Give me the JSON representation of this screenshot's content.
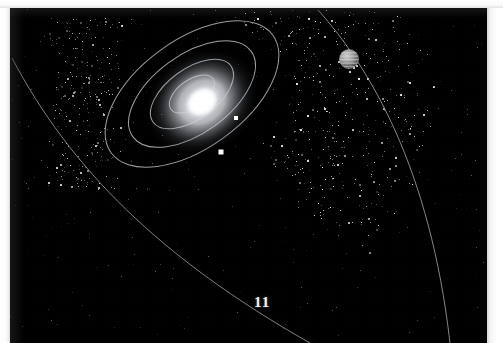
{
  "page": {
    "number": "11",
    "kind": "scanned-book-illustration",
    "background_color": "#000000",
    "paper_color": "#ffffff",
    "width": 503,
    "height": 343
  },
  "scene": {
    "title": "Solar system with central star, inner orbits and outer gas giant",
    "star": {
      "name": "central-star",
      "center_x": 202,
      "center_y": 102,
      "core_radius": 15,
      "glow_radius": 62,
      "color": "#ffffff",
      "halo_color": "#cfd4dc"
    },
    "orbits": [
      {
        "name": "orbit-1",
        "rx": 26,
        "ry": 14,
        "rotation": -36,
        "stroke": "#b9bcc2"
      },
      {
        "name": "orbit-2",
        "rx": 48,
        "ry": 25,
        "rotation": -36,
        "stroke": "#b5b8be"
      },
      {
        "name": "orbit-3",
        "rx": 73,
        "ry": 39,
        "rotation": -36,
        "stroke": "#aeb1b7"
      },
      {
        "name": "orbit-4",
        "rx": 100,
        "ry": 54,
        "rotation": -36,
        "stroke": "#a8abb1"
      }
    ],
    "planets": [
      {
        "name": "inner-planet-1",
        "x": 236,
        "y": 118,
        "size": 4,
        "color": "#ffffff"
      },
      {
        "name": "inner-planet-2",
        "x": 221,
        "y": 152,
        "size": 5,
        "color": "#ffffff"
      }
    ],
    "gas_giant": {
      "name": "gas-giant",
      "x": 349,
      "y": 59,
      "radius": 10,
      "color": "#8d8d8d",
      "band_color": "#c6c6c6",
      "bands": 6
    },
    "outer_orbit_arcs": [
      {
        "name": "outer-orbit-arc-left",
        "stroke": "#9da0a6"
      },
      {
        "name": "outer-orbit-arc-right",
        "stroke": "#a5a8ae"
      }
    ],
    "asteroid_belt": {
      "name": "asteroid-belt-starfield",
      "point_count": 900,
      "color": "#e8e8e8"
    },
    "star_field_cluster": {
      "name": "upper-left-star-cluster",
      "point_count": 260,
      "color": "#d8d8d8"
    }
  },
  "chart_data": {
    "type": "scatter",
    "xlabel": "",
    "ylabel": "",
    "series": [
      {
        "name": "central star",
        "x": [
          202
        ],
        "y": [
          102
        ]
      },
      {
        "name": "inner planets",
        "x": [
          236,
          221
        ],
        "y": [
          118,
          152
        ]
      },
      {
        "name": "gas giant",
        "x": [
          349
        ],
        "y": [
          59
        ]
      }
    ],
    "annotations": [
      "11"
    ],
    "grid": false,
    "legend": "none"
  }
}
